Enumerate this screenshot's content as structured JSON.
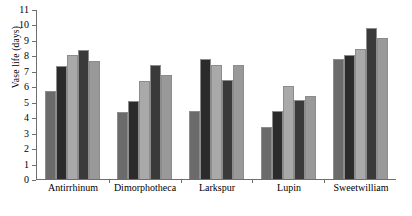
{
  "chart_data": {
    "type": "bar",
    "title": "",
    "xlabel": "",
    "ylabel": "Vase life (days)",
    "ylim": [
      0,
      11
    ],
    "ytick_labels": [
      "0",
      "1",
      "2",
      "3",
      "4",
      "5",
      "6",
      "7",
      "8",
      "9",
      "10",
      "11"
    ],
    "grid": false,
    "legend": "none",
    "categories": [
      "Antirrhinum",
      "Dimorphotheca",
      "Larkspur",
      "Lupin",
      "Sweetwilliam"
    ],
    "series": [
      {
        "name": "Treatment 1",
        "values": [
          5.7,
          4.35,
          4.4,
          3.35,
          7.75
        ]
      },
      {
        "name": "Treatment 2",
        "values": [
          7.3,
          5.05,
          7.75,
          4.4,
          8.05
        ]
      },
      {
        "name": "Treatment 3",
        "values": [
          8.0,
          6.35,
          7.4,
          6.05,
          8.4
        ]
      },
      {
        "name": "Treatment 4",
        "values": [
          8.35,
          7.35,
          6.4,
          5.1,
          9.75
        ]
      },
      {
        "name": "Treatment 5",
        "values": [
          7.65,
          6.7,
          7.4,
          5.4,
          9.1
        ]
      }
    ],
    "series_colors": [
      "#6b6b6b",
      "#2b2b2b",
      "#a9a9a9",
      "#3a3a3a",
      "#999999"
    ]
  }
}
